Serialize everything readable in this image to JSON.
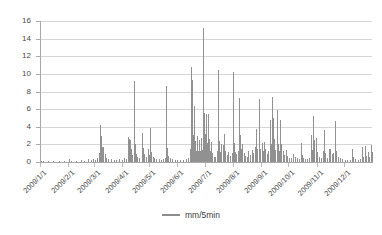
{
  "chart_data": {
    "type": "line",
    "title": "",
    "subtitle": "",
    "xlabel": "",
    "ylabel": "",
    "ylim": [
      0,
      16
    ],
    "yticks": [
      0,
      2,
      4,
      6,
      8,
      10,
      12,
      14,
      16
    ],
    "grid": true,
    "legend_position": "bottom",
    "xtick_labels": [
      "2009/1/1",
      "2009/2/1",
      "2009/3/1",
      "2009/4/1",
      "2009/5/1",
      "2009/6/1",
      "2009/7/1",
      "2009/8/1",
      "2009/9/1",
      "2009/10/1",
      "2009/11/1",
      "2009/12/1"
    ],
    "xtick_positions_pct": [
      0,
      8.5,
      16.2,
      24.7,
      32.9,
      41.4,
      49.6,
      58.1,
      66.6,
      74.8,
      83.3,
      91.5
    ],
    "series": [
      {
        "name": "mm/5min",
        "color": "#919191",
        "units": "mm per 5 minutes",
        "x_range": [
          "2009/1/1",
          "2009/12/31"
        ],
        "peak_max": 15.2,
        "peak_max_date_approx": "2009/6/1",
        "points": [
          [
            0.3,
            0.15
          ],
          [
            1.0,
            0.1
          ],
          [
            2.4,
            0.1
          ],
          [
            4.0,
            0.12
          ],
          [
            5.6,
            0.1
          ],
          [
            7.2,
            0.1
          ],
          [
            8.6,
            0.3
          ],
          [
            9.4,
            0.15
          ],
          [
            10.8,
            0.1
          ],
          [
            12.2,
            0.25
          ],
          [
            13.4,
            0.1
          ],
          [
            14.6,
            0.35
          ],
          [
            15.3,
            0.2
          ],
          [
            16.0,
            0.3
          ],
          [
            16.6,
            0.25
          ],
          [
            17.2,
            0.5
          ],
          [
            17.8,
            1.0
          ],
          [
            18.2,
            4.2
          ],
          [
            18.5,
            3.0
          ],
          [
            18.8,
            1.7
          ],
          [
            19.1,
            1.75
          ],
          [
            19.5,
            0.9
          ],
          [
            20.0,
            0.5
          ],
          [
            20.6,
            0.35
          ],
          [
            21.4,
            0.3
          ],
          [
            22.2,
            0.25
          ],
          [
            23.0,
            0.2
          ],
          [
            23.9,
            0.3
          ],
          [
            24.6,
            0.25
          ],
          [
            25.3,
            0.4
          ],
          [
            25.9,
            0.35
          ],
          [
            26.4,
            2.85
          ],
          [
            26.7,
            2.6
          ],
          [
            27.0,
            2.45
          ],
          [
            27.4,
            1.5
          ],
          [
            27.8,
            0.8
          ],
          [
            28.2,
            9.2
          ],
          [
            28.5,
            2.0
          ],
          [
            28.9,
            0.9
          ],
          [
            29.3,
            0.6
          ],
          [
            29.9,
            0.5
          ],
          [
            30.6,
            3.3
          ],
          [
            30.9,
            1.6
          ],
          [
            31.3,
            0.9
          ],
          [
            31.8,
            0.55
          ],
          [
            32.4,
            1.45
          ],
          [
            32.8,
            0.8
          ],
          [
            33.2,
            3.85
          ],
          [
            33.5,
            1.1
          ],
          [
            33.9,
            0.6
          ],
          [
            34.4,
            0.45
          ],
          [
            35.0,
            0.35
          ],
          [
            35.7,
            0.3
          ],
          [
            36.4,
            0.25
          ],
          [
            37.0,
            0.3
          ],
          [
            37.6,
            0.4
          ],
          [
            38.0,
            8.65
          ],
          [
            38.3,
            1.6
          ],
          [
            38.7,
            0.7
          ],
          [
            39.2,
            0.4
          ],
          [
            39.8,
            0.3
          ],
          [
            40.6,
            0.25
          ],
          [
            41.4,
            0.2
          ],
          [
            42.3,
            0.2
          ],
          [
            43.2,
            0.25
          ],
          [
            44.0,
            0.3
          ],
          [
            44.7,
            0.4
          ],
          [
            45.2,
            1.5
          ],
          [
            45.5,
            10.8
          ],
          [
            45.7,
            4.2
          ],
          [
            45.9,
            9.3
          ],
          [
            46.1,
            3.1
          ],
          [
            46.3,
            6.3
          ],
          [
            46.5,
            2.2
          ],
          [
            46.8,
            2.4
          ],
          [
            47.1,
            1.3
          ],
          [
            47.4,
            2.9
          ],
          [
            47.7,
            1.2
          ],
          [
            48.0,
            2.5
          ],
          [
            48.3,
            1.3
          ],
          [
            48.6,
            2.75
          ],
          [
            48.9,
            1.4
          ],
          [
            49.2,
            15.2
          ],
          [
            49.4,
            5.6
          ],
          [
            49.6,
            3.2
          ],
          [
            49.9,
            5.5
          ],
          [
            50.2,
            2.2
          ],
          [
            50.5,
            5.4
          ],
          [
            50.8,
            2.6
          ],
          [
            51.1,
            1.3
          ],
          [
            51.5,
            2.3
          ],
          [
            51.9,
            1.0
          ],
          [
            52.3,
            0.6
          ],
          [
            52.8,
            0.55
          ],
          [
            53.3,
            1.3
          ],
          [
            53.7,
            10.4
          ],
          [
            53.9,
            2.4
          ],
          [
            54.2,
            1.1
          ],
          [
            54.6,
            2.05
          ],
          [
            55.0,
            1.9
          ],
          [
            55.4,
            3.15
          ],
          [
            55.8,
            1.25
          ],
          [
            56.2,
            0.8
          ],
          [
            56.7,
            1.15
          ],
          [
            57.2,
            0.7
          ],
          [
            57.7,
            1.0
          ],
          [
            58.2,
            10.25
          ],
          [
            58.4,
            2.2
          ],
          [
            58.7,
            1.1
          ],
          [
            59.1,
            0.9
          ],
          [
            59.6,
            1.3
          ],
          [
            60.0,
            7.3
          ],
          [
            60.2,
            3.1
          ],
          [
            60.5,
            1.5
          ],
          [
            60.9,
            2.0
          ],
          [
            61.3,
            1.0
          ],
          [
            61.8,
            0.7
          ],
          [
            62.3,
            0.6
          ],
          [
            62.8,
            1.2
          ],
          [
            63.3,
            0.8
          ],
          [
            63.8,
            1.4
          ],
          [
            64.3,
            1.0
          ],
          [
            64.8,
            1.7
          ],
          [
            65.2,
            3.7
          ],
          [
            65.5,
            1.5
          ],
          [
            65.9,
            7.2
          ],
          [
            66.1,
            2.3
          ],
          [
            66.4,
            1.5
          ],
          [
            66.8,
            2.2
          ],
          [
            67.1,
            1.3
          ],
          [
            67.5,
            2.25
          ],
          [
            67.9,
            1.5
          ],
          [
            68.3,
            0.9
          ],
          [
            68.8,
            1.2
          ],
          [
            69.3,
            4.8
          ],
          [
            69.6,
            2.0
          ],
          [
            70.0,
            7.4
          ],
          [
            70.2,
            5.0
          ],
          [
            70.5,
            2.6
          ],
          [
            70.9,
            1.4
          ],
          [
            71.3,
            5.9
          ],
          [
            71.6,
            2.1
          ],
          [
            72.0,
            1.3
          ],
          [
            72.4,
            4.8
          ],
          [
            72.7,
            2.0
          ],
          [
            73.1,
            1.2
          ],
          [
            73.6,
            0.8
          ],
          [
            74.1,
            1.4
          ],
          [
            74.5,
            0.7
          ],
          [
            75.0,
            0.5
          ],
          [
            75.6,
            0.45
          ],
          [
            76.2,
            0.9
          ],
          [
            76.7,
            0.55
          ],
          [
            77.3,
            0.4
          ],
          [
            77.9,
            0.35
          ],
          [
            78.5,
            2.2
          ],
          [
            78.8,
            0.8
          ],
          [
            79.3,
            0.45
          ],
          [
            79.9,
            0.35
          ],
          [
            80.5,
            0.3
          ],
          [
            81.1,
            0.5
          ],
          [
            81.6,
            3.1
          ],
          [
            81.9,
            1.4
          ],
          [
            82.3,
            5.25
          ],
          [
            82.6,
            2.5
          ],
          [
            83.0,
            2.7
          ],
          [
            83.4,
            1.1
          ],
          [
            83.9,
            0.6
          ],
          [
            84.5,
            0.4
          ],
          [
            85.1,
            1.3
          ],
          [
            85.6,
            3.65
          ],
          [
            85.9,
            1.0
          ],
          [
            86.4,
            0.5
          ],
          [
            87.0,
            1.5
          ],
          [
            87.4,
            1.45
          ],
          [
            87.9,
            0.9
          ],
          [
            88.4,
            1.0
          ],
          [
            88.9,
            4.7
          ],
          [
            89.2,
            1.2
          ],
          [
            89.7,
            0.6
          ],
          [
            90.3,
            0.5
          ],
          [
            91.0,
            0.35
          ],
          [
            91.8,
            0.25
          ],
          [
            92.6,
            0.2
          ],
          [
            93.4,
            0.25
          ],
          [
            94.0,
            1.45
          ],
          [
            94.4,
            0.6
          ],
          [
            95.0,
            0.3
          ],
          [
            95.7,
            0.25
          ],
          [
            96.4,
            0.3
          ],
          [
            97.0,
            1.7
          ],
          [
            97.4,
            0.6
          ],
          [
            97.9,
            1.8
          ],
          [
            98.3,
            0.7
          ],
          [
            98.8,
            1.1
          ],
          [
            99.2,
            0.55
          ],
          [
            99.6,
            1.95
          ],
          [
            99.9,
            1.1
          ]
        ]
      }
    ]
  },
  "legend": {
    "entries": [
      {
        "label": "mm/5min",
        "color": "#919191"
      }
    ]
  }
}
